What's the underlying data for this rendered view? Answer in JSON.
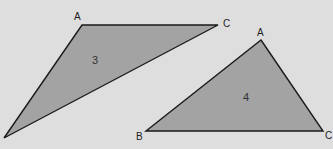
{
  "colors": {
    "background": "#dedede",
    "fill": "#a3a3a3",
    "stroke": "#1a1a1a"
  },
  "triangles": [
    {
      "id": "3",
      "label": "3",
      "vertices": {
        "A": {
          "label": "A",
          "x": 82,
          "y": 25
        },
        "C": {
          "label": "C",
          "x": 218,
          "y": 25
        },
        "B": {
          "label": "",
          "x": 4,
          "y": 138
        }
      }
    },
    {
      "id": "4",
      "label": "4",
      "vertices": {
        "A": {
          "label": "A",
          "x": 261,
          "y": 40
        },
        "B": {
          "label": "B",
          "x": 146,
          "y": 131
        },
        "C": {
          "label": "C",
          "x": 323,
          "y": 131
        }
      }
    }
  ]
}
